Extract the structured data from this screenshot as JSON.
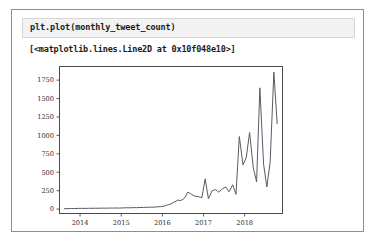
{
  "notebook": {
    "code_input": "plt.plot(monthly_tweet_count)",
    "output_repr": "[<matplotlib.lines.Line2D at 0x10f048e10>]"
  },
  "chart_data": {
    "type": "line",
    "title": "",
    "xlabel": "",
    "ylabel": "",
    "xlim": [
      2013.5,
      2018.92
    ],
    "ylim": [
      -60,
      1935
    ],
    "grid": false,
    "legend": null,
    "xticks": [
      2014,
      2015,
      2016,
      2017,
      2018
    ],
    "xtick_labels": [
      "2014",
      "2015",
      "2016",
      "2017",
      "2018"
    ],
    "yticks": [
      0,
      250,
      500,
      750,
      1000,
      1250,
      1500,
      1750
    ],
    "ytick_labels": [
      "0",
      "250",
      "500",
      "750",
      "1000",
      "1250",
      "1500",
      "1750"
    ],
    "line_color": "#5a5a66",
    "series": [
      {
        "name": "monthly_tweet_count",
        "x": [
          2013.62,
          2013.71,
          2013.79,
          2013.87,
          2013.96,
          2014.04,
          2014.12,
          2014.21,
          2014.29,
          2014.37,
          2014.46,
          2014.54,
          2014.62,
          2014.71,
          2014.79,
          2014.87,
          2014.96,
          2015.04,
          2015.12,
          2015.21,
          2015.29,
          2015.37,
          2015.46,
          2015.54,
          2015.62,
          2015.71,
          2015.79,
          2015.87,
          2015.96,
          2016.04,
          2016.12,
          2016.21,
          2016.29,
          2016.37,
          2016.46,
          2016.54,
          2016.62,
          2016.71,
          2016.79,
          2016.87,
          2016.96,
          2017.04,
          2017.12,
          2017.21,
          2017.29,
          2017.37,
          2017.46,
          2017.54,
          2017.62,
          2017.71,
          2017.79,
          2017.87,
          2017.96,
          2018.04,
          2018.12,
          2018.21,
          2018.29,
          2018.37,
          2018.46,
          2018.54,
          2018.62,
          2018.71,
          2018.79
        ],
        "values": [
          5,
          6,
          8,
          7,
          9,
          10,
          9,
          11,
          10,
          12,
          11,
          13,
          12,
          14,
          13,
          15,
          14,
          16,
          18,
          17,
          20,
          19,
          22,
          21,
          24,
          26,
          25,
          30,
          34,
          40,
          55,
          70,
          95,
          120,
          118,
          150,
          230,
          200,
          175,
          170,
          155,
          410,
          140,
          250,
          265,
          230,
          275,
          300,
          235,
          330,
          200,
          985,
          600,
          700,
          1040,
          560,
          370,
          1645,
          610,
          300,
          640,
          1860,
          1160
        ]
      }
    ]
  }
}
